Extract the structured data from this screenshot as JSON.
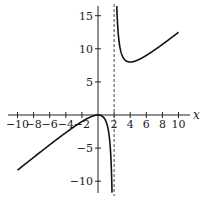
{
  "chart_data": {
    "type": "line",
    "title": "",
    "function": "x^2/(x-2)",
    "xlabel": "x",
    "ylabel": "",
    "xlim": [
      -11,
      11.5
    ],
    "ylim": [
      -11.5,
      16.5
    ],
    "x_ticks": [
      -10,
      -8,
      -6,
      -4,
      -2,
      2,
      4,
      6,
      8,
      10
    ],
    "x_tick_labels": [
      "−10",
      "−8",
      "−6",
      "−4",
      "−2",
      "2",
      "4",
      "6",
      "8",
      "10"
    ],
    "y_ticks": [
      15,
      10,
      5,
      -5,
      -10
    ],
    "y_tick_labels": [
      "15",
      "10",
      "5",
      "−5",
      "−10"
    ],
    "grid": false,
    "legend": null,
    "asymptotes": [
      {
        "type": "vertical",
        "x": 2,
        "style": "dashed"
      }
    ],
    "series": [
      {
        "name": "left branch",
        "x": [
          -10,
          -8,
          -6,
          -4,
          -2,
          -1,
          0,
          1,
          1.5,
          1.8
        ],
        "values": [
          -8.33,
          -6.4,
          -4.5,
          -2.67,
          -1,
          -0.33,
          0,
          -1,
          -4.5,
          -16.2
        ]
      },
      {
        "name": "right branch",
        "x": [
          2.2,
          2.5,
          3,
          4,
          5,
          6,
          8,
          10
        ],
        "values": [
          24.2,
          12.5,
          9,
          8,
          8.33,
          9,
          10.67,
          12.5
        ]
      }
    ],
    "annotations": []
  },
  "colors": {
    "curve": "#111111",
    "axis": "#222222",
    "asymptote": "#444444",
    "background": "#ffffff"
  }
}
